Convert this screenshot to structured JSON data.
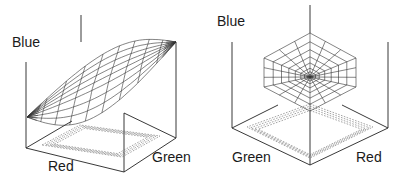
{
  "figures": [
    {
      "id": "left",
      "labels": [
        {
          "text": "Blue",
          "x": 12,
          "y": 47,
          "axis": "blue"
        },
        {
          "text": "Red",
          "x": 48,
          "y": 171,
          "axis": "red"
        },
        {
          "text": "Green",
          "x": 152,
          "y": 162,
          "axis": "green"
        }
      ]
    },
    {
      "id": "right",
      "labels": [
        {
          "text": "Blue",
          "x": 217,
          "y": 26,
          "axis": "blue"
        },
        {
          "text": "Green",
          "x": 232,
          "y": 162,
          "axis": "green"
        },
        {
          "text": "Red",
          "x": 356,
          "y": 162,
          "axis": "red"
        }
      ]
    }
  ],
  "labels": {
    "left_blue": "Blue",
    "left_red": "Red",
    "left_green": "Green",
    "right_blue": "Blue",
    "right_green": "Green",
    "right_red": "Red"
  },
  "colors": {
    "stroke": "#222222",
    "mesh": "#333333",
    "dashed": "#666666",
    "background": "#ffffff"
  }
}
